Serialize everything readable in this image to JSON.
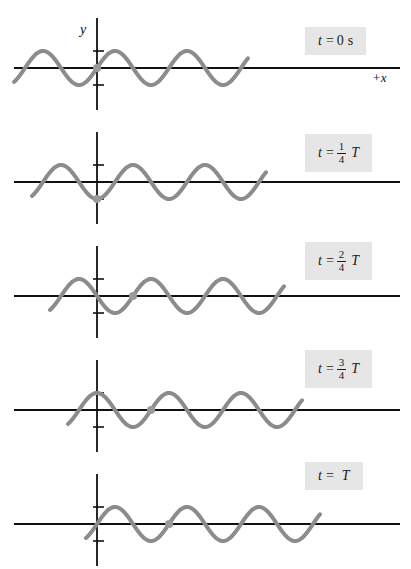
{
  "figure": {
    "axis": {
      "y_label": "y",
      "x_label": "+x"
    },
    "colors": {
      "wave": "#8c8c8c",
      "axis": "#111111",
      "marker": "#9a9a9a",
      "label_bg": "#e6e6e6",
      "label_text": "#1a1a1a",
      "background": "#ffffff"
    },
    "panels": [
      {
        "id": "panel-1",
        "label": {
          "lhs": "t",
          "eq": "=",
          "value": "0",
          "unit": "s",
          "fraction": null,
          "period": null
        },
        "label_plain": "t = 0 s",
        "shift_fraction": 0,
        "marker_y": 0,
        "has_axis_labels": true
      },
      {
        "id": "panel-2",
        "label": {
          "lhs": "t",
          "eq": "=",
          "value": null,
          "unit": null,
          "fraction": {
            "num": "1",
            "den": "4"
          },
          "period": "T"
        },
        "label_plain": "t = 1/4 T",
        "shift_fraction": 0.25,
        "marker_y": -1,
        "has_axis_labels": false
      },
      {
        "id": "panel-3",
        "label": {
          "lhs": "t",
          "eq": "=",
          "value": null,
          "unit": null,
          "fraction": {
            "num": "2",
            "den": "4"
          },
          "period": "T"
        },
        "label_plain": "t = 2/4 T",
        "shift_fraction": 0.5,
        "marker_y": 0,
        "has_axis_labels": false
      },
      {
        "id": "panel-4",
        "label": {
          "lhs": "t",
          "eq": "=",
          "value": null,
          "unit": null,
          "fraction": {
            "num": "3",
            "den": "4"
          },
          "period": "T"
        },
        "label_plain": "t = 3/4 T",
        "shift_fraction": 0.75,
        "marker_y": 1,
        "has_axis_labels": false
      },
      {
        "id": "panel-5",
        "label": {
          "lhs": "t",
          "eq": "=",
          "value": null,
          "unit": null,
          "fraction": null,
          "period": "T"
        },
        "label_plain": "t = T",
        "shift_fraction": 1.0,
        "marker_y": 0,
        "has_axis_labels": false
      }
    ]
  },
  "chart_data": {
    "type": "line",
    "xlabel": "+x",
    "ylabel": "y",
    "wavelength_px": 72,
    "amplitude_px": 17,
    "origin_x_px": 97,
    "wave_start_px": 14,
    "wave_end_px": 248,
    "axis_line_start_px": 14,
    "axis_line_end_px": 400,
    "series": [
      {
        "name": "t = 0 s",
        "phase_shift_wavelengths": 0.0,
        "marker_point": {
          "x": 0,
          "y": 0
        }
      },
      {
        "name": "t = 1/4 T",
        "phase_shift_wavelengths": 0.25,
        "marker_point": {
          "x": 0,
          "y": -17
        }
      },
      {
        "name": "t = 2/4 T",
        "phase_shift_wavelengths": 0.5,
        "marker_point": {
          "x": 0,
          "y": 0
        }
      },
      {
        "name": "t = 3/4 T",
        "phase_shift_wavelengths": 0.75,
        "marker_point": {
          "x": 0,
          "y": 17
        }
      },
      {
        "name": "t = T",
        "phase_shift_wavelengths": 1.0,
        "marker_point": {
          "x": 0,
          "y": 0
        }
      }
    ],
    "grid": false,
    "legend": "none"
  }
}
